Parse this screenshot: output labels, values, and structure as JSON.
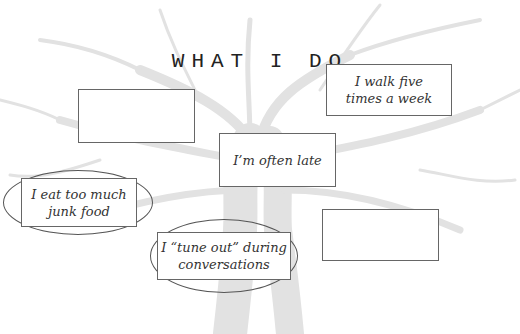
{
  "title": "WHAT I DO",
  "background": {
    "image": "tree-sketch",
    "tint": "#e6e6e6"
  },
  "boxes": [
    {
      "id": "blank-top-left",
      "text": "",
      "circled": false
    },
    {
      "id": "walk",
      "text": "I walk five times a week",
      "lines": [
        "I walk five",
        "times a week"
      ],
      "circled": false
    },
    {
      "id": "late",
      "text": "I'm often late",
      "lines": [
        "I’m often late"
      ],
      "circled": false
    },
    {
      "id": "junk-food",
      "text": "I eat too much junk food",
      "lines": [
        "I eat too much",
        "junk food"
      ],
      "circled": true
    },
    {
      "id": "tune-out",
      "text": "I “tune out” during conversations",
      "lines": [
        "I “tune out” during",
        "conversations"
      ],
      "circled": true
    },
    {
      "id": "blank-bottom-right",
      "text": "",
      "circled": false
    }
  ],
  "colors": {
    "border": "#666666",
    "circle": "#555555",
    "text": "#333333"
  }
}
